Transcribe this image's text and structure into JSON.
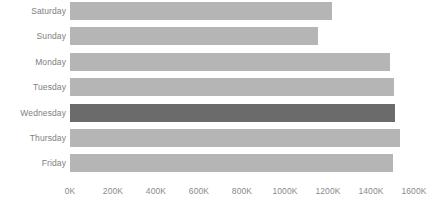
{
  "chart_data": {
    "type": "bar",
    "orientation": "horizontal",
    "title": "",
    "subtitle": "",
    "xlabel": "",
    "ylabel": "",
    "categories": [
      "Saturday",
      "Sunday",
      "Monday",
      "Tuesday",
      "Wednesday",
      "Thursday",
      "Friday"
    ],
    "values": [
      1220000,
      1155000,
      1490000,
      1505000,
      1510000,
      1535000,
      1500000
    ],
    "series": [
      {
        "name": "Volume",
        "values": [
          1220000,
          1155000,
          1490000,
          1505000,
          1510000,
          1535000,
          1500000
        ]
      }
    ],
    "xlim": [
      0,
      1600000
    ],
    "xtick_values": [
      0,
      200000,
      400000,
      600000,
      800000,
      1000000,
      1200000,
      1400000,
      1600000
    ],
    "xtick_labels": [
      "0K",
      "200K",
      "400K",
      "600K",
      "800K",
      "1000K",
      "1200K",
      "1400K",
      "1600K"
    ],
    "grid": false,
    "legend": null,
    "legend_position": "none",
    "annotations": [],
    "highlighted_category": "Wednesday",
    "colors": {
      "bar": "#b5b5b5",
      "bar_highlighted": "#6b6b6b",
      "category_label": "#808080",
      "tick_label": "#8a8a8a",
      "background": "#ffffff"
    }
  },
  "bars": [
    {
      "label": "Saturday",
      "value": 1220000,
      "value_label": "1220K",
      "highlighted": false
    },
    {
      "label": "Sunday",
      "value": 1155000,
      "value_label": "1155K",
      "highlighted": false
    },
    {
      "label": "Monday",
      "value": 1490000,
      "value_label": "1490K",
      "highlighted": false
    },
    {
      "label": "Tuesday",
      "value": 1505000,
      "value_label": "1505K",
      "highlighted": false
    },
    {
      "label": "Wednesday",
      "value": 1510000,
      "value_label": "1510K",
      "highlighted": true
    },
    {
      "label": "Thursday",
      "value": 1535000,
      "value_label": "1535K",
      "highlighted": false
    },
    {
      "label": "Friday",
      "value": 1500000,
      "value_label": "1500K",
      "highlighted": false
    }
  ],
  "x_axis": {
    "ticks": [
      {
        "label": "0K",
        "value": 0
      },
      {
        "label": "200K",
        "value": 200000
      },
      {
        "label": "400K",
        "value": 400000
      },
      {
        "label": "600K",
        "value": 600000
      },
      {
        "label": "800K",
        "value": 800000
      },
      {
        "label": "1000K",
        "value": 1000000
      },
      {
        "label": "1200K",
        "value": 1200000
      },
      {
        "label": "1400K",
        "value": 1400000
      },
      {
        "label": "1600K",
        "value": 1600000
      }
    ]
  }
}
